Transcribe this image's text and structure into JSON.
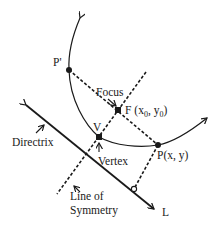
{
  "diagram": {
    "type": "parabola-geometry",
    "colors": {
      "stroke": "#1a1a1a",
      "background": "#ffffff"
    },
    "points": {
      "p_prime": {
        "label": "P'"
      },
      "focus": {
        "label": "F",
        "coord_x": "x",
        "coord_x_sub": "0",
        "coord_y": "y",
        "coord_y_sub": "0",
        "caption": "Focus"
      },
      "vertex": {
        "label": "V",
        "caption": "Vertex"
      },
      "point_p": {
        "label": "P(x, y)"
      }
    },
    "lines": {
      "directrix": {
        "caption": "Directrix",
        "end_label": "L"
      },
      "symmetry": {
        "caption_line1": "Line of",
        "caption_line2": "Symmetry"
      }
    }
  }
}
